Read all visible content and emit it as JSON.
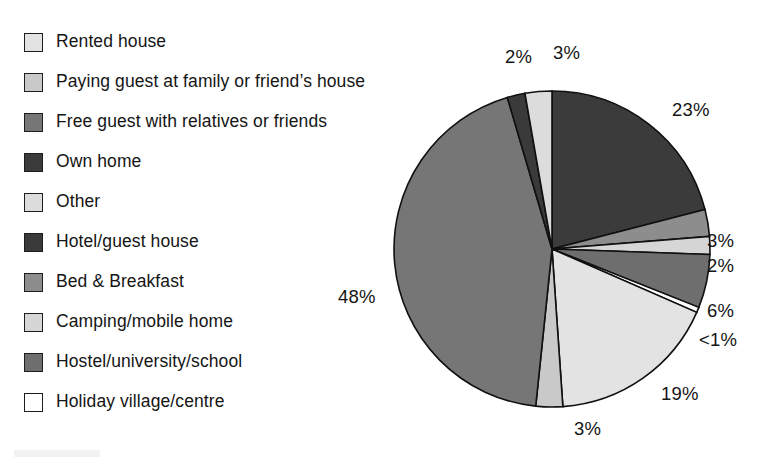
{
  "chart_data": {
    "type": "pie",
    "title": "",
    "subtitle": "",
    "xlabel": "",
    "ylabel": "",
    "legend_position": "left",
    "grid": false,
    "units": "percent",
    "start_angle_deg": 0,
    "direction": "clockwise",
    "categories": [
      "Rented house",
      "Paying guest at family or friend’s house",
      "Free guest with relatives or friends",
      "Own home",
      "Other",
      "Hotel/guest house",
      "Bed & Breakfast",
      "Camping/mobile home",
      "Hostel/university/school",
      "Holiday village/centre"
    ],
    "values": [
      19,
      3,
      48,
      23,
      3,
      2,
      3,
      2,
      6,
      0.6
    ],
    "value_labels": [
      "19%",
      "3%",
      "48%",
      "23%",
      "3%",
      "2%",
      "3%",
      "2%",
      "6%",
      "<1%"
    ],
    "colors": [
      "#e3e3e3",
      "#c9c9c9",
      "#767676",
      "#3b3b3b",
      "#dcdcdc",
      "#3a3a3a",
      "#8d8d8d",
      "#d6d6d6",
      "#6e6e6e",
      "#ffffff"
    ]
  },
  "legend": {
    "items": [
      {
        "label": "Rented house",
        "color": "#e3e3e3",
        "swatch_name": "swatch-rented-house"
      },
      {
        "label": "Paying guest at family or friend’s house",
        "color": "#c9c9c9",
        "swatch_name": "swatch-paying-guest"
      },
      {
        "label": "Free guest with relatives or friends",
        "color": "#767676",
        "swatch_name": "swatch-free-guest"
      },
      {
        "label": "Own home",
        "color": "#3b3b3b",
        "swatch_name": "swatch-own-home"
      },
      {
        "label": "Other",
        "color": "#dcdcdc",
        "swatch_name": "swatch-other"
      },
      {
        "label": "Hotel/guest house",
        "color": "#3a3a3a",
        "swatch_name": "swatch-hotel-guest-house"
      },
      {
        "label": "Bed & Breakfast",
        "color": "#8d8d8d",
        "swatch_name": "swatch-bed-and-breakfast"
      },
      {
        "label": "Camping/mobile home",
        "color": "#d6d6d6",
        "swatch_name": "swatch-camping-mobile-home"
      },
      {
        "label": "Hostel/university/school",
        "color": "#6e6e6e",
        "swatch_name": "swatch-hostel-university-school"
      },
      {
        "label": "Holiday village/centre",
        "color": "#ffffff",
        "swatch_name": "swatch-holiday-village-centre"
      }
    ]
  },
  "pie": {
    "center_x": 552,
    "center_y": 249,
    "radius": 158,
    "slices": [
      {
        "category": "Own home",
        "value": 23,
        "label": "23%",
        "color": "#3b3b3b"
      },
      {
        "category": "Bed & Breakfast",
        "value": 3,
        "label": "3%",
        "color": "#8d8d8d"
      },
      {
        "category": "Camping/mobile home",
        "value": 2,
        "label": "2%",
        "color": "#d6d6d6"
      },
      {
        "category": "Hostel/university/school",
        "value": 6,
        "label": "6%",
        "color": "#6e6e6e"
      },
      {
        "category": "Holiday village/centre",
        "value": 0.6,
        "label": "<1%",
        "color": "#ffffff"
      },
      {
        "category": "Rented house",
        "value": 19,
        "label": "19%",
        "color": "#e3e3e3"
      },
      {
        "category": "Paying guest at family or friend’s house",
        "value": 3,
        "label": "3%",
        "color": "#c9c9c9"
      },
      {
        "category": "Free guest with relatives or friends",
        "value": 48,
        "label": "48%",
        "color": "#767676"
      },
      {
        "category": "Hotel/guest house",
        "value": 2,
        "label": "2%",
        "color": "#3a3a3a"
      },
      {
        "category": "Other",
        "value": 3,
        "label": "3%",
        "color": "#dcdcdc"
      }
    ],
    "callouts": [
      {
        "name": "pct-label-23",
        "text": "23%",
        "left": 672,
        "top": 101
      },
      {
        "name": "pct-label-3-bb",
        "text": "3%",
        "left": 707,
        "top": 232
      },
      {
        "name": "pct-label-2-camping",
        "text": "2%",
        "left": 707,
        "top": 257
      },
      {
        "name": "pct-label-6",
        "text": "6%",
        "left": 707,
        "top": 302
      },
      {
        "name": "pct-label-lt1",
        "text": "<1%",
        "left": 699,
        "top": 331
      },
      {
        "name": "pct-label-19",
        "text": "19%",
        "left": 661,
        "top": 385
      },
      {
        "name": "pct-label-3-paying",
        "text": "3%",
        "left": 574,
        "top": 420
      },
      {
        "name": "pct-label-48",
        "text": "48%",
        "left": 338,
        "top": 288
      },
      {
        "name": "pct-label-2-hotel",
        "text": "2%",
        "left": 505,
        "top": 48
      },
      {
        "name": "pct-label-3-other",
        "text": "3%",
        "left": 553,
        "top": 44
      }
    ]
  }
}
